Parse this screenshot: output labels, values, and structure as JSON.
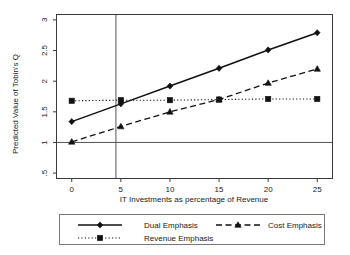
{
  "chart_data": {
    "type": "line",
    "title": "",
    "subtitle": "",
    "xlabel": "IT Investments as percentage of Revenue",
    "ylabel": "Predicted Value of Tobin's Q",
    "x": [
      0,
      5,
      10,
      15,
      20,
      25
    ],
    "xticklabels": [
      "0",
      "5",
      "10",
      "15",
      "20",
      "25"
    ],
    "yticklabels": [
      ".5",
      "1",
      "1.5",
      "2",
      "2.5",
      "3"
    ],
    "ytickvalues": [
      0.5,
      1,
      1.5,
      2,
      2.5,
      3
    ],
    "xlim": [
      -1.5,
      26.5
    ],
    "ylim": [
      0.42,
      3.08
    ],
    "grid": false,
    "legend_position": "bottom",
    "series": [
      {
        "name": "Dual Emphasis",
        "marker": "diamond",
        "linestyle": "solid",
        "values": [
          1.34,
          1.63,
          1.92,
          2.21,
          2.51,
          2.79
        ]
      },
      {
        "name": "Cost Emphasis",
        "marker": "triangle",
        "linestyle": "dashed",
        "values": [
          1.01,
          1.26,
          1.5,
          1.7,
          1.97,
          2.2
        ]
      },
      {
        "name": "Revenue Emphasis",
        "marker": "square",
        "linestyle": "dotted",
        "values": [
          1.68,
          1.69,
          1.69,
          1.7,
          1.71,
          1.71
        ]
      }
    ],
    "reference_lines": [
      {
        "name": "horizontal-reference-at-1",
        "orientation": "horizontal",
        "value": 1
      },
      {
        "name": "vertical-reference-at-4.5",
        "orientation": "vertical",
        "value": 4.5
      }
    ],
    "annotations": []
  },
  "legend": {
    "entries": [
      {
        "label": "Dual Emphasis"
      },
      {
        "label": "Cost Emphasis"
      },
      {
        "label": "Revenue Emphasis"
      }
    ]
  },
  "colors": {
    "ink": "#111111",
    "axis": "#3a3a3a",
    "reference": "#555555",
    "legend_border": "#777777",
    "background": "#ffffff"
  }
}
